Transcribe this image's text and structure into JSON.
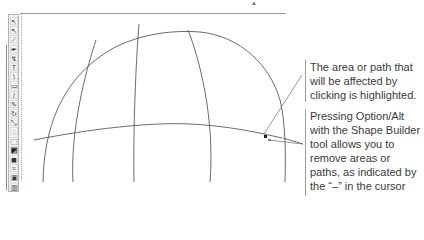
{
  "toolbar": {
    "tools": [
      {
        "name": "selection-tool",
        "glyph": "↖"
      },
      {
        "name": "direct-selection-tool",
        "glyph": "↖"
      },
      {
        "name": "magic-wand-tool",
        "glyph": "⁄"
      },
      {
        "name": "pen-tool",
        "glyph": "✒"
      },
      {
        "name": "anchor-tool",
        "glyph": "↯"
      },
      {
        "name": "type-tool",
        "glyph": "T"
      },
      {
        "name": "line-tool",
        "glyph": "\\"
      },
      {
        "name": "rectangle-tool",
        "glyph": "▭"
      },
      {
        "name": "pencil-tool",
        "glyph": "/"
      },
      {
        "name": "brush-tool",
        "glyph": "✎"
      },
      {
        "name": "rotate-tool",
        "glyph": "↻"
      },
      {
        "name": "scale-tool",
        "glyph": "⤡"
      },
      {
        "name": "warp-tool",
        "glyph": "◌"
      },
      {
        "name": "free-transform-tool",
        "glyph": "⬚"
      },
      {
        "name": "shape-builder-tool",
        "glyph": "◩"
      },
      {
        "name": "gradient-tool",
        "glyph": "◼"
      },
      {
        "name": "mesh-tool",
        "glyph": "⌗"
      },
      {
        "name": "blend-tool",
        "glyph": "▣"
      },
      {
        "name": "graph-tool",
        "glyph": "▥"
      }
    ],
    "active_tool": "shape-builder-tool"
  },
  "callouts": [
    {
      "text": "The area or path that will be affected by clicking is highlighted."
    },
    {
      "text": "Pressing Option/Alt with the Shape Builder tool allows you to remove areas or paths, as indicated by the “–” in the cursor icon."
    }
  ],
  "colors": {
    "stroke": "#5a5a5a",
    "text": "#3a3a3a",
    "leader": "#6a6a6a"
  }
}
